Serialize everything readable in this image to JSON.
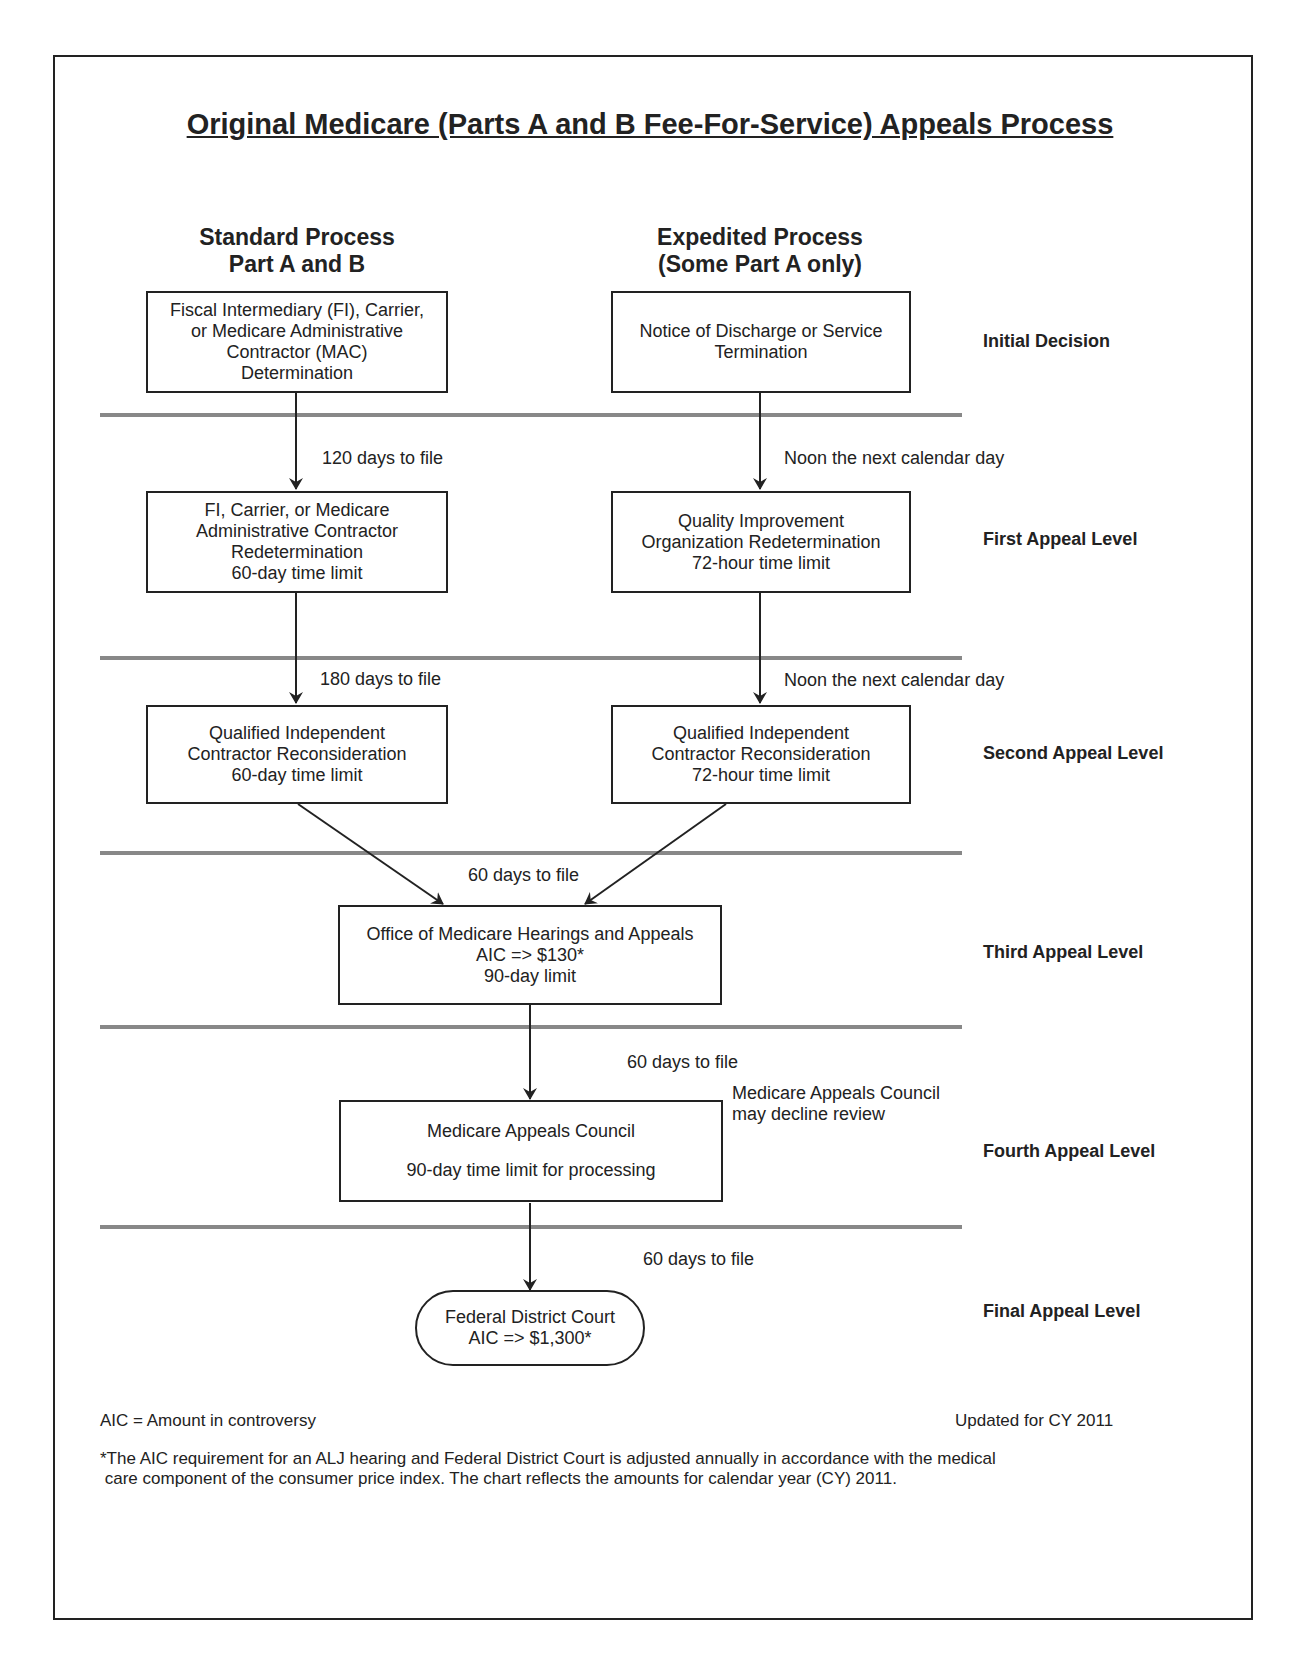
{
  "title": "Original Medicare (Parts A and B Fee-For-Service) Appeals Process",
  "columns": {
    "standard": {
      "line1": "Standard Process",
      "line2": "Part A and B"
    },
    "expedited": {
      "line1": "Expedited Process",
      "line2": "(Some Part A only)"
    }
  },
  "levels": [
    "Initial Decision",
    "First Appeal Level",
    "Second Appeal Level",
    "Third Appeal Level",
    "Fourth Appeal Level",
    "Final Appeal Level"
  ],
  "boxes": {
    "std_initial": [
      "Fiscal Intermediary (FI), Carrier,",
      "or Medicare Administrative",
      "Contractor (MAC)",
      "Determination"
    ],
    "exp_initial": [
      "Notice of Discharge or Service",
      "Termination"
    ],
    "std_first": [
      "FI, Carrier, or Medicare",
      "Administrative Contractor",
      "Redetermination",
      "60-day time limit"
    ],
    "exp_first": [
      "Quality Improvement",
      "Organization Redetermination",
      "72-hour time limit"
    ],
    "std_second": [
      "Qualified Independent",
      "Contractor Reconsideration",
      "60-day time limit"
    ],
    "exp_second": [
      "Qualified Independent",
      "Contractor Reconsideration",
      "72-hour time limit"
    ],
    "third": [
      "Office of Medicare Hearings and Appeals",
      "AIC => $130*",
      "90-day limit"
    ],
    "fourth": [
      "Medicare Appeals Council",
      "90-day time limit for processing"
    ],
    "final": [
      "Federal District Court",
      "AIC => $1,300*"
    ]
  },
  "arrow_labels": {
    "std_to_first": "120 days to file",
    "exp_to_first": "Noon the next calendar day",
    "std_to_second": "180 days to file",
    "exp_to_second": "Noon the next calendar day",
    "to_third": "60 days to file",
    "to_fourth": "60 days to file",
    "council_note_1": "Medicare Appeals Council",
    "council_note_2": "may decline review",
    "to_final": "60 days to file"
  },
  "footer": {
    "aic_def": "AIC = Amount in controversy",
    "updated": "Updated for CY 2011",
    "note_1": "*The AIC requirement for an ALJ hearing and Federal District Court is adjusted annually in accordance with the medical",
    "note_2": " care component of the consumer price index. The chart reflects the amounts for calendar year (CY) 2011."
  }
}
